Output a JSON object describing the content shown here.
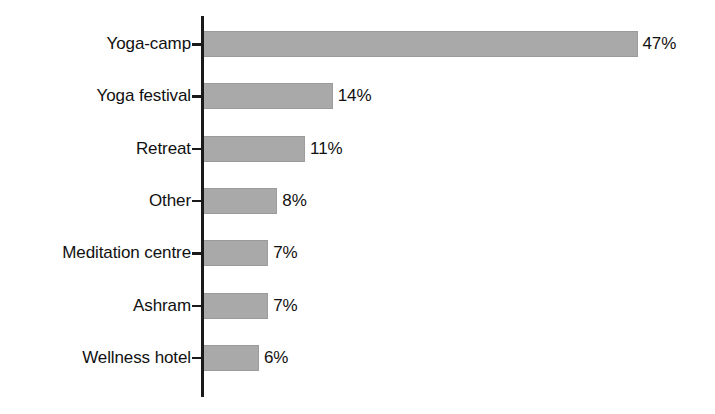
{
  "chart_data": {
    "type": "bar",
    "orientation": "horizontal",
    "title": "",
    "subtitle": "",
    "xlabel": "",
    "ylabel": "",
    "xlim": [
      0,
      47
    ],
    "grid": false,
    "legend": null,
    "value_suffix": "%",
    "bar_color": "#a9a9a9",
    "axis_color": "#1a1a1a",
    "background_color": "#ffffff",
    "categories": [
      "Yoga-camp",
      "Yoga festival",
      "Retreat",
      "Other",
      "Meditation centre",
      "Ashram",
      "Wellness hotel"
    ],
    "values": [
      47,
      14,
      11,
      8,
      7,
      7,
      6
    ],
    "data_labels": [
      "47%",
      "14%",
      "11%",
      "8%",
      "7%",
      "7%",
      "6%"
    ],
    "points": [
      {
        "category": "Yoga-camp",
        "value": 47,
        "label": "47%"
      },
      {
        "category": "Yoga festival",
        "value": 14,
        "label": "14%"
      },
      {
        "category": "Retreat",
        "value": 11,
        "label": "11%"
      },
      {
        "category": "Other",
        "value": 8,
        "label": "8%"
      },
      {
        "category": "Meditation centre",
        "value": 7,
        "label": "7%"
      },
      {
        "category": "Ashram",
        "value": 7,
        "label": "7%"
      },
      {
        "category": "Wellness hotel",
        "value": 6,
        "label": "6%"
      }
    ]
  }
}
